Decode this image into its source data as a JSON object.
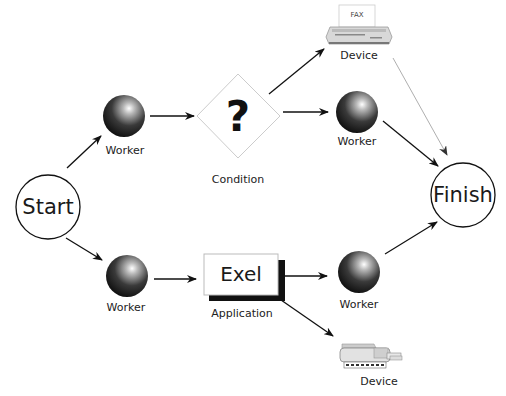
{
  "diagram": {
    "nodes": {
      "start": {
        "label": "Start",
        "type": "terminal"
      },
      "finish": {
        "label": "Finish",
        "type": "terminal"
      },
      "worker_top": {
        "label": "Worker",
        "type": "worker"
      },
      "condition": {
        "label": "Condition",
        "symbol": "?",
        "type": "condition"
      },
      "worker_top_right": {
        "label": "Worker",
        "type": "worker"
      },
      "fax_device": {
        "label": "Device",
        "screen_text": "FAX",
        "type": "device"
      },
      "worker_bottom": {
        "label": "Worker",
        "type": "worker"
      },
      "application": {
        "label": "Application",
        "box_text": "Exel",
        "type": "application"
      },
      "worker_bottom_right": {
        "label": "Worker",
        "type": "worker"
      },
      "printer_device": {
        "label": "Device",
        "type": "device"
      }
    },
    "edges": [
      {
        "from": "start",
        "to": "worker_top"
      },
      {
        "from": "worker_top",
        "to": "condition"
      },
      {
        "from": "condition",
        "to": "fax_device"
      },
      {
        "from": "condition",
        "to": "worker_top_right"
      },
      {
        "from": "fax_device",
        "to": "finish",
        "style": "light"
      },
      {
        "from": "worker_top_right",
        "to": "finish"
      },
      {
        "from": "start",
        "to": "worker_bottom"
      },
      {
        "from": "worker_bottom",
        "to": "application"
      },
      {
        "from": "application",
        "to": "worker_bottom_right"
      },
      {
        "from": "application",
        "to": "printer_device"
      },
      {
        "from": "worker_bottom_right",
        "to": "finish"
      }
    ]
  }
}
